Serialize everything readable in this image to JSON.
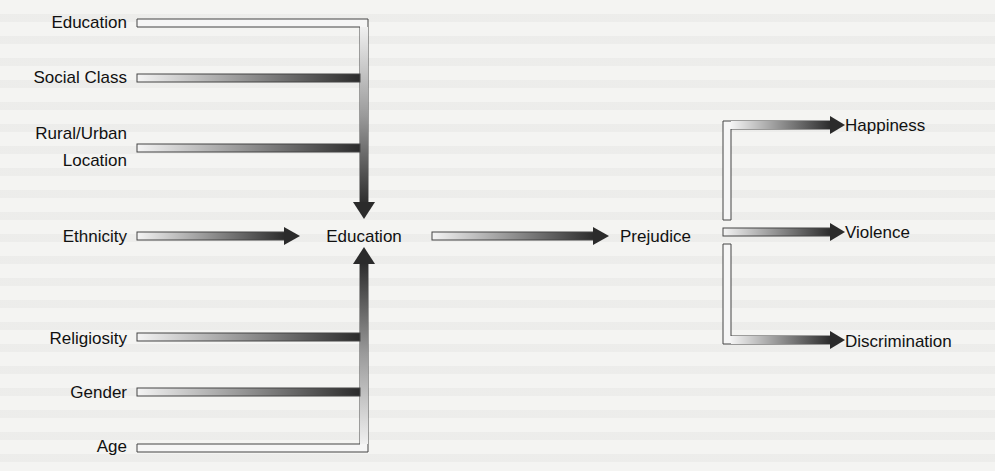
{
  "diagram": {
    "type": "causal-path-diagram",
    "inputs": [
      {
        "id": "education_in",
        "label": "Education"
      },
      {
        "id": "social_class",
        "label": "Social Class"
      },
      {
        "id": "rural_urban",
        "label_line1": "Rural/Urban",
        "label_line2": "Location"
      },
      {
        "id": "ethnicity",
        "label": "Ethnicity"
      },
      {
        "id": "religiosity",
        "label": "Religiosity"
      },
      {
        "id": "gender",
        "label": "Gender"
      },
      {
        "id": "age",
        "label": "Age"
      }
    ],
    "center": {
      "id": "education_mid",
      "label": "Education"
    },
    "mediator": {
      "id": "prejudice",
      "label": "Prejudice"
    },
    "outcomes": [
      {
        "id": "happiness",
        "label": "Happiness"
      },
      {
        "id": "violence",
        "label": "Violence"
      },
      {
        "id": "discrimination",
        "label": "Discrimination"
      }
    ],
    "edges": [
      {
        "from": "education_in",
        "to": "education_mid"
      },
      {
        "from": "social_class",
        "to": "education_mid"
      },
      {
        "from": "rural_urban",
        "to": "education_mid"
      },
      {
        "from": "ethnicity",
        "to": "education_mid"
      },
      {
        "from": "religiosity",
        "to": "education_mid"
      },
      {
        "from": "gender",
        "to": "education_mid"
      },
      {
        "from": "age",
        "to": "education_mid"
      },
      {
        "from": "education_mid",
        "to": "prejudice"
      },
      {
        "from": "prejudice",
        "to": "happiness"
      },
      {
        "from": "prejudice",
        "to": "violence"
      },
      {
        "from": "prejudice",
        "to": "discrimination"
      }
    ],
    "colors": {
      "background": "#f4f4f2",
      "arrow_light": "#f2f2f2",
      "arrow_dark": "#2e2e2e",
      "outline": "#444444",
      "text": "#111111"
    }
  }
}
